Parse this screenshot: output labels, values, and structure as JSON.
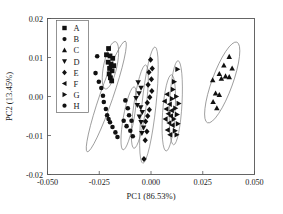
{
  "chart_data": {
    "type": "scatter",
    "title": "",
    "xlabel": "PC1 (86.53%)",
    "ylabel": "PC2 (13.45%)",
    "xlim": [
      -0.05,
      0.05
    ],
    "ylim": [
      -0.02,
      0.02
    ],
    "xticks": [
      "-0.050",
      "-0.025",
      "0.000",
      "0.025",
      "0.050"
    ],
    "xtick_values": [
      -0.05,
      -0.025,
      0.0,
      0.025,
      0.05
    ],
    "yticks": [
      "0.02",
      "0.01",
      "0.00",
      "-0.01",
      "-0.02"
    ],
    "ytick_values": [
      0.02,
      0.01,
      0.0,
      -0.01,
      -0.02
    ],
    "grid": false,
    "legend_position": "top-left inside",
    "marker_color": "#111111",
    "ellipse_color": "#777777",
    "series": [
      {
        "name": "A",
        "marker": "square",
        "points": [
          [
            -0.0205,
            0.0123
          ],
          [
            -0.0215,
            0.0107
          ],
          [
            -0.0198,
            0.0104
          ],
          [
            -0.0185,
            0.0098
          ],
          [
            -0.0207,
            0.0088
          ],
          [
            -0.0193,
            0.0083
          ],
          [
            -0.018,
            0.0079
          ],
          [
            -0.02,
            0.0072
          ],
          [
            -0.0188,
            0.0066
          ],
          [
            -0.0202,
            0.0058
          ],
          [
            -0.0196,
            0.0048
          ],
          [
            -0.019,
            0.004
          ]
        ],
        "ellipse": {
          "cx": -0.0196,
          "cy": 0.008,
          "rx": 0.0032,
          "ry": 0.0062,
          "rot": 12
        }
      },
      {
        "name": "B",
        "marker": "circle",
        "points": [
          [
            -0.026,
            0.0103
          ],
          [
            -0.0268,
            0.006
          ],
          [
            -0.0252,
            0.0038
          ],
          [
            -0.024,
            0.0022
          ],
          [
            -0.0232,
            0.0002
          ],
          [
            -0.0228,
            -0.0014
          ],
          [
            -0.0218,
            -0.0032
          ],
          [
            -0.0212,
            -0.0048
          ],
          [
            -0.0205,
            -0.0058
          ],
          [
            -0.0198,
            -0.0066
          ],
          [
            -0.0186,
            -0.0078
          ],
          [
            -0.0172,
            -0.0092
          ],
          [
            -0.0162,
            -0.0104
          ]
        ],
        "ellipse": {
          "cx": -0.0216,
          "cy": 0.0,
          "rx": 0.0032,
          "ry": 0.015,
          "rot": 19
        }
      },
      {
        "name": "C",
        "marker": "triangle-up",
        "points": [
          [
            0.0378,
            0.0102
          ],
          [
            0.0352,
            0.008
          ],
          [
            0.0392,
            0.0072
          ],
          [
            0.033,
            0.0058
          ],
          [
            0.036,
            0.0052
          ],
          [
            0.0378,
            0.005
          ],
          [
            0.034,
            0.0046
          ],
          [
            0.0298,
            0.0042
          ],
          [
            0.0312,
            0.0008
          ],
          [
            0.033,
            0.0004
          ],
          [
            0.03,
            -0.0014
          ],
          [
            0.0318,
            -0.003
          ]
        ],
        "ellipse": {
          "cx": 0.0344,
          "cy": 0.0036,
          "rx": 0.005,
          "ry": 0.011,
          "rot": 20
        }
      },
      {
        "name": "D",
        "marker": "triangle-down",
        "points": [
          [
            -0.0062,
            0.0036
          ],
          [
            -0.0048,
            0.0022
          ],
          [
            -0.0058,
            0.0008
          ],
          [
            -0.0072,
            -0.0004
          ],
          [
            -0.0066,
            -0.0022
          ],
          [
            -0.005,
            -0.0028
          ],
          [
            -0.0042,
            -0.004
          ],
          [
            -0.0056,
            -0.0052
          ],
          [
            -0.0048,
            -0.0066
          ],
          [
            -0.0036,
            -0.008
          ],
          [
            -0.0044,
            -0.0094
          ]
        ],
        "ellipse": {
          "cx": -0.0054,
          "cy": -0.0026,
          "rx": 0.003,
          "ry": 0.0108,
          "rot": 8
        }
      },
      {
        "name": "E",
        "marker": "diamond",
        "points": [
          [
            -0.0002,
            0.0094
          ],
          [
            0.0006,
            0.0072
          ],
          [
            -0.001,
            0.0062
          ],
          [
            0.0002,
            0.0044
          ],
          [
            -0.0014,
            0.003
          ],
          [
            0.0004,
            0.0014
          ],
          [
            -0.0006,
            -0.0002
          ],
          [
            -0.0018,
            -0.0016
          ],
          [
            -0.0008,
            -0.0034
          ],
          [
            -0.0016,
            -0.005
          ],
          [
            -0.0026,
            -0.0064
          ],
          [
            -0.002,
            -0.009
          ],
          [
            -0.0028,
            -0.0112
          ],
          [
            -0.0034,
            -0.016
          ]
        ],
        "ellipse": {
          "cx": -0.001,
          "cy": -0.0022,
          "rx": 0.0034,
          "ry": 0.015,
          "rot": 6
        }
      },
      {
        "name": "F",
        "marker": "triangle-left",
        "points": [
          [
            0.0078,
            0.0006
          ],
          [
            0.0066,
            -0.0012
          ],
          [
            0.009,
            -0.002
          ],
          [
            0.0074,
            -0.0032
          ],
          [
            0.01,
            -0.0036
          ],
          [
            0.0084,
            -0.0044
          ],
          [
            0.0096,
            -0.005
          ],
          [
            0.007,
            -0.0058
          ],
          [
            0.0088,
            -0.0068
          ],
          [
            0.0104,
            -0.0074
          ],
          [
            0.008,
            -0.0086
          ],
          [
            0.0092,
            -0.0098
          ]
        ],
        "ellipse": {
          "cx": 0.0086,
          "cy": -0.0042,
          "rx": 0.003,
          "ry": 0.0098,
          "rot": 4
        }
      },
      {
        "name": "G",
        "marker": "triangle-right",
        "points": [
          [
            0.0128,
            0.007
          ],
          [
            0.0112,
            0.0038
          ],
          [
            0.0106,
            0.0018
          ],
          [
            0.0122,
            0.0
          ],
          [
            0.0102,
            -0.0006
          ],
          [
            0.0134,
            -0.0018
          ],
          [
            0.0118,
            -0.003
          ],
          [
            0.0126,
            -0.0046
          ],
          [
            0.011,
            -0.0058
          ],
          [
            0.013,
            -0.007
          ],
          [
            0.0116,
            -0.0088
          ],
          [
            0.0124,
            -0.0098
          ]
        ],
        "ellipse": {
          "cx": 0.012,
          "cy": -0.0016,
          "rx": 0.003,
          "ry": 0.0108,
          "rot": 3
        }
      },
      {
        "name": "H",
        "marker": "circle",
        "points": [
          [
            -0.0124,
            -0.001
          ],
          [
            -0.0112,
            -0.003
          ],
          [
            -0.0106,
            -0.0048
          ],
          [
            -0.0094,
            -0.0062
          ],
          [
            -0.0118,
            -0.0076
          ],
          [
            -0.01,
            -0.0088
          ],
          [
            -0.0088,
            -0.0102
          ],
          [
            -0.0132,
            -0.0062
          ]
        ],
        "ellipse": {
          "cx": -0.0108,
          "cy": -0.0056,
          "rx": 0.0026,
          "ry": 0.0082,
          "rot": 10
        }
      }
    ],
    "legend": [
      {
        "label": "A",
        "marker": "square"
      },
      {
        "label": "B",
        "marker": "circle"
      },
      {
        "label": "C",
        "marker": "triangle-up"
      },
      {
        "label": "D",
        "marker": "triangle-down"
      },
      {
        "label": "E",
        "marker": "diamond"
      },
      {
        "label": "F",
        "marker": "triangle-left"
      },
      {
        "label": "G",
        "marker": "triangle-right"
      },
      {
        "label": "H",
        "marker": "circle"
      }
    ]
  }
}
